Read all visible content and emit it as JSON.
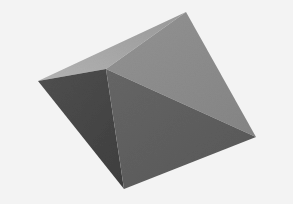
{
  "scene": {
    "subject": "3D rendered square pyramid",
    "background_color": "#f3f3f3",
    "vertices": {
      "top": [
        186,
        12
      ],
      "left": [
        38,
        81
      ],
      "apex": [
        106,
        69
      ],
      "right": [
        256,
        137
      ],
      "bottom": [
        124,
        189
      ]
    },
    "faces": [
      {
        "name": "top-left-face",
        "color": "#a4a4a4",
        "points": "38,81 186,12 106,69"
      },
      {
        "name": "top-right-face",
        "color": "#8c8c8c",
        "points": "106,69 186,12 256,137"
      },
      {
        "name": "left-face",
        "color": "#4a4a4a",
        "points": "38,81 106,69 124,189"
      },
      {
        "name": "bottom-right-face",
        "color": "#5f5f5f",
        "points": "106,69 256,137 124,189"
      }
    ]
  }
}
